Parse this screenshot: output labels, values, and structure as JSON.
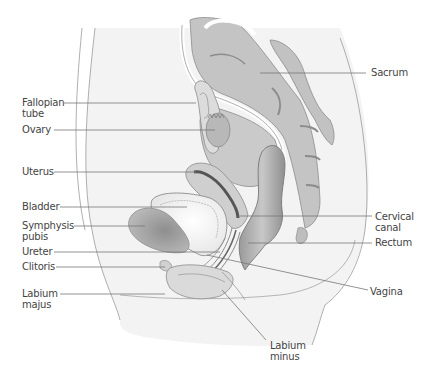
{
  "diagram": {
    "type": "anatomical cross-section",
    "labels": [
      {
        "id": "fallopian_tube",
        "text": "Fallopian\ntube",
        "line1": "Fallopian",
        "line2": "tube",
        "side": "left"
      },
      {
        "id": "ovary",
        "text": "Ovary",
        "side": "left"
      },
      {
        "id": "uterus",
        "text": "Uterus",
        "side": "left"
      },
      {
        "id": "bladder",
        "text": "Bladder",
        "side": "left"
      },
      {
        "id": "symphysis_pubis",
        "text": "Symphysis\npubis",
        "line1": "Symphysis",
        "line2": "pubis",
        "side": "left"
      },
      {
        "id": "ureter",
        "text": "Ureter",
        "side": "left"
      },
      {
        "id": "clitoris",
        "text": "Clitoris",
        "side": "left"
      },
      {
        "id": "labium_majus",
        "text": "Labium\nmajus",
        "line1": "Labium",
        "line2": "majus",
        "side": "left"
      },
      {
        "id": "sacrum",
        "text": "Sacrum",
        "side": "right"
      },
      {
        "id": "cervical_canal",
        "text": "Cervical\ncanal",
        "line1": "Cervical",
        "line2": "canal",
        "side": "right"
      },
      {
        "id": "rectum",
        "text": "Rectum",
        "side": "right"
      },
      {
        "id": "vagina",
        "text": "Vagina",
        "side": "right"
      },
      {
        "id": "labium_minus",
        "text": "Labium\nminus",
        "line1": "Labium",
        "line2": "minus",
        "side": "bottom"
      }
    ]
  },
  "colors": {
    "leader_line": "#777777",
    "outline": "#888888",
    "body_fill": "#f1f1f1",
    "organ_light": "#d8d8d8",
    "organ_mid": "#b5b5b5",
    "organ_dark": "#8a8a8a",
    "label_text": "#444444"
  }
}
